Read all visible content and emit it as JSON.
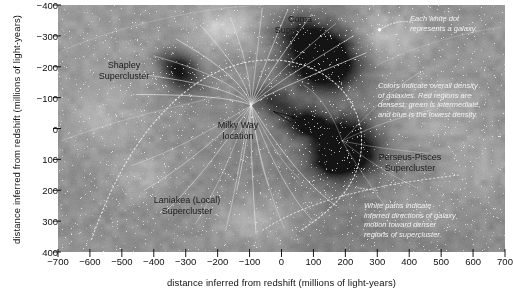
{
  "chart_data": {
    "type": "scatter",
    "title": "",
    "xlabel": "distance inferred from redshift (millions of light-years)",
    "ylabel": "distance inferred from redshift (millions of light-years)",
    "xlim": [
      -700,
      700
    ],
    "ylim": [
      -400,
      400
    ],
    "x_ticks": [
      -700,
      -600,
      -500,
      -400,
      -300,
      -200,
      -100,
      0,
      100,
      200,
      300,
      400,
      500,
      600,
      700
    ],
    "y_ticks": [
      -400,
      -300,
      -200,
      -100,
      0,
      100,
      200,
      300,
      400
    ],
    "grid": false,
    "y_axis_inverted": true,
    "legend": "none",
    "colormap_meaning": "density of galaxies: red densest, green intermediate, blue lowest",
    "annotations": [
      {
        "name": "coma-supercluster",
        "text": "Coma\nSupercluster",
        "x": 20,
        "y": -370,
        "kind": "structure"
      },
      {
        "name": "shapley-supercluster",
        "text": "Shapley\nSupercluster",
        "x": -530,
        "y": -215,
        "kind": "structure"
      },
      {
        "name": "milky-way-location",
        "text": "Milky Way\nlocation",
        "x": -90,
        "y": -45,
        "kind": "structure"
      },
      {
        "name": "perseus-pisces-supercluster",
        "text": "Perseus-Pisces\nSupercluster",
        "x": 345,
        "y": 55,
        "kind": "structure"
      },
      {
        "name": "laniakea-supercluster",
        "text": "Laniakea (Local)\nSupercluster",
        "x": -290,
        "y": 225,
        "kind": "structure"
      },
      {
        "name": "galaxy-dot-note",
        "text": "Each white dot\nrepresents a galaxy.",
        "x": 460,
        "y": -375,
        "kind": "note"
      },
      {
        "name": "color-density-note",
        "text": "Colors indicate overall density\nof galaxies. Red regions are\ndensest, green is intermediate,\nand blue is the lowest density.",
        "x": 460,
        "y": -150,
        "kind": "note"
      },
      {
        "name": "white-paths-note",
        "text": "White paths indicate\ninferred directions of galaxy\nmotion toward denser\nregions of supercluster.",
        "x": 460,
        "y": 190,
        "kind": "note"
      }
    ]
  },
  "axes": {
    "x_title": "distance inferred from redshift (millions of light-years)",
    "y_title": "distance inferred from redshift (millions of light-years)",
    "x_tick_labels": [
      "−700",
      "−600",
      "−500",
      "−400",
      "−300",
      "−200",
      "−100",
      "0",
      "100",
      "200",
      "300",
      "400",
      "500",
      "600",
      "700"
    ],
    "y_tick_labels": [
      "−400",
      "−300",
      "−200",
      "−100",
      "0",
      "100",
      "200",
      "300",
      "400"
    ]
  },
  "labels": {
    "coma": "Coma\nSupercluster",
    "shapley": "Shapley\nSupercluster",
    "milky_way": "Milky Way\nlocation",
    "perseus_pisces": "Perseus-Pisces\nSupercluster",
    "laniakea": "Laniakea (Local)\nSupercluster"
  },
  "notes": {
    "galaxy_dot": "Each white dot\nrepresents a galaxy.",
    "color_density": "Colors indicate overall density\nof galaxies. Red regions are\ndensest, green is intermediate,\nand blue is the lowest density.",
    "white_paths": "White paths indicate\ninferred directions of galaxy\nmotion toward denser\nregions of supercluster."
  },
  "colors": {
    "background": "#8e8e8e",
    "dense_region": "#4a4a4a",
    "flow_line": "#f0f0f0",
    "boundary": "#e8e8e8",
    "note_text": "#f2f2f2",
    "label_text": "#1a1a1a",
    "axis": "#000000"
  }
}
